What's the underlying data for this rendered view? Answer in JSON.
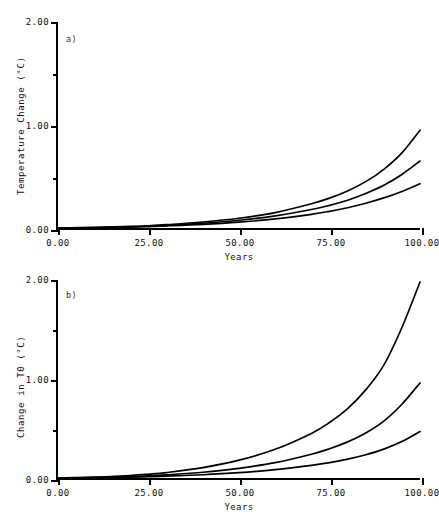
{
  "figure": {
    "background": "#ffffff",
    "line_color": "#000000"
  },
  "panels": [
    {
      "tag": "a)",
      "ylabel": "Temperature Change (°C)",
      "xlabel": "Years"
    },
    {
      "tag": "b)",
      "ylabel": "Change in T0 (°C)",
      "xlabel": "Years"
    }
  ],
  "caption": "",
  "chart_data": [
    {
      "type": "line",
      "title": "",
      "panel": "a)",
      "xlabel": "Years",
      "ylabel": "Temperature Change (°C)",
      "xlim": [
        0,
        100
      ],
      "ylim": [
        0,
        2.0
      ],
      "xticks": [
        0,
        25,
        50,
        75,
        100
      ],
      "xticklabels": [
        "0.00",
        "25.00",
        "50.00",
        "75.00",
        "100.00"
      ],
      "yticks": [
        0,
        0.5,
        1.0,
        1.5,
        2.0
      ],
      "yticklabels": [
        "0.00",
        "",
        "1.00",
        "",
        "2.00"
      ],
      "ytick_labeled": [
        0,
        1.0,
        2.0
      ],
      "grid": false,
      "legend": "none",
      "x": [
        0,
        10,
        20,
        25,
        30,
        40,
        50,
        60,
        70,
        75,
        80,
        85,
        90,
        95,
        100
      ],
      "series": [
        {
          "name": "upper",
          "values": [
            0.0,
            0.005,
            0.015,
            0.022,
            0.032,
            0.058,
            0.095,
            0.15,
            0.235,
            0.29,
            0.36,
            0.45,
            0.57,
            0.73,
            0.95
          ]
        },
        {
          "name": "middle",
          "values": [
            0.0,
            0.004,
            0.012,
            0.018,
            0.026,
            0.046,
            0.075,
            0.118,
            0.18,
            0.22,
            0.27,
            0.335,
            0.415,
            0.52,
            0.65
          ]
        },
        {
          "name": "lower",
          "values": [
            0.0,
            0.003,
            0.009,
            0.014,
            0.02,
            0.035,
            0.057,
            0.088,
            0.133,
            0.162,
            0.197,
            0.24,
            0.292,
            0.355,
            0.43
          ]
        }
      ]
    },
    {
      "type": "line",
      "title": "",
      "panel": "b)",
      "xlabel": "Years",
      "ylabel": "Change in T0 (°C)",
      "xlim": [
        0,
        100
      ],
      "ylim": [
        0,
        2.0
      ],
      "xticks": [
        0,
        25,
        50,
        75,
        100
      ],
      "xticklabels": [
        "0.00",
        "25.00",
        "50.00",
        "75.00",
        "100.00"
      ],
      "yticks": [
        0,
        0.5,
        1.0,
        1.5,
        2.0
      ],
      "yticklabels": [
        "0.00",
        "",
        "1.00",
        "",
        "2.00"
      ],
      "ytick_labeled": [
        0,
        1.0,
        2.0
      ],
      "grid": false,
      "legend": "none",
      "x": [
        0,
        10,
        20,
        25,
        30,
        40,
        50,
        60,
        70,
        75,
        80,
        85,
        90,
        95,
        100
      ],
      "series": [
        {
          "name": "upper",
          "values": [
            0.0,
            0.008,
            0.025,
            0.038,
            0.055,
            0.105,
            0.18,
            0.29,
            0.45,
            0.56,
            0.7,
            0.89,
            1.14,
            1.52,
            1.98
          ]
        },
        {
          "name": "middle",
          "values": [
            0.0,
            0.005,
            0.015,
            0.022,
            0.032,
            0.058,
            0.098,
            0.155,
            0.24,
            0.295,
            0.365,
            0.455,
            0.575,
            0.745,
            0.96
          ]
        },
        {
          "name": "lower",
          "values": [
            0.0,
            0.003,
            0.009,
            0.013,
            0.019,
            0.033,
            0.054,
            0.084,
            0.127,
            0.155,
            0.19,
            0.235,
            0.292,
            0.368,
            0.47
          ]
        }
      ]
    }
  ]
}
